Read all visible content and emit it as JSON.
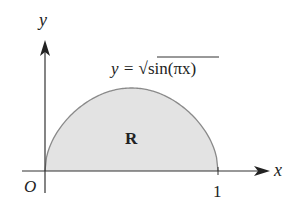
{
  "diagram": {
    "type": "region under curve",
    "axes": {
      "x_label": "x",
      "y_label": "y",
      "origin_label": "O",
      "x_tick_label": "1"
    },
    "curve": {
      "equation_lhs": "y = ",
      "equation_radical": "√",
      "equation_func": "sin",
      "equation_arg": "(πx)",
      "equation_full": "y = √sin(πx)"
    },
    "region": {
      "label": "R",
      "fill_color": "#e3e3e3"
    },
    "colors": {
      "axis": "#333333",
      "curve": "#8a8a8a",
      "fill": "#e3e3e3"
    }
  },
  "chart_data": {
    "type": "area",
    "title": "",
    "xlabel": "x",
    "ylabel": "y",
    "function": "y = sqrt(sin(pi*x))",
    "x": [
      0,
      0.1,
      0.2,
      0.3,
      0.4,
      0.5,
      0.6,
      0.7,
      0.8,
      0.9,
      1.0
    ],
    "values": [
      0,
      0.556,
      0.767,
      0.899,
      0.975,
      1.0,
      0.975,
      0.899,
      0.767,
      0.556,
      0
    ],
    "xlim": [
      0,
      1
    ],
    "ylim": [
      0,
      1
    ],
    "annotations": [
      "O",
      "1",
      "R",
      "y = √sin(πx)"
    ],
    "grid": false,
    "legend": null
  }
}
